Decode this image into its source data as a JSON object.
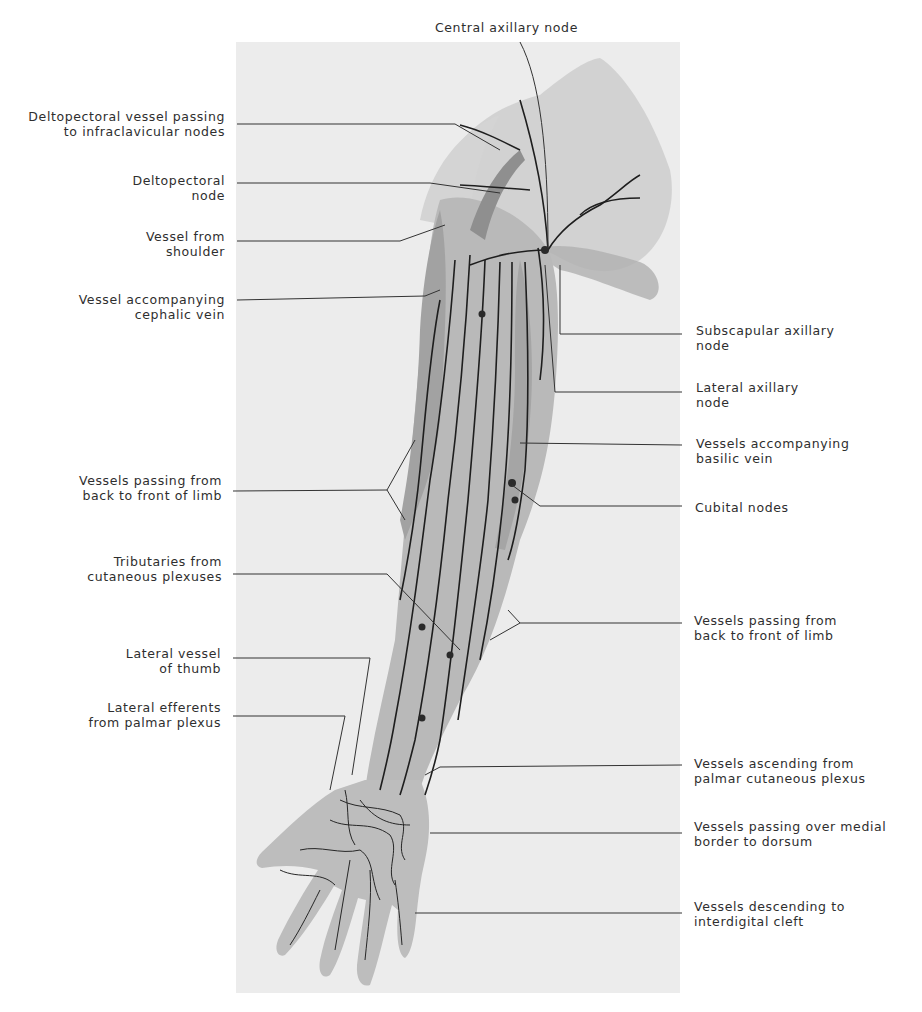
{
  "figure": {
    "colors": {
      "page_background": "#ffffff",
      "panel_background": "#ececec",
      "limb_fill": "#b8b8b8",
      "limb_shadow": "#9a9a9a",
      "vessel": "#1e1e1e",
      "leader_line": "#333333",
      "label_text": "#2e2e2e"
    }
  },
  "labels": {
    "top": {
      "central_axillary_node": {
        "lines": [
          "Central axillary node"
        ]
      }
    },
    "left": [
      {
        "id": "deltopectoral_vessel",
        "lines": [
          "Deltopectoral vessel passing",
          "to infraclavicular nodes"
        ]
      },
      {
        "id": "deltopectoral_node",
        "lines": [
          "Deltopectoral",
          "node"
        ]
      },
      {
        "id": "vessel_from_shoulder",
        "lines": [
          "Vessel from",
          "shoulder"
        ]
      },
      {
        "id": "vessel_cephalic",
        "lines": [
          "Vessel accompanying",
          "cephalic vein"
        ]
      },
      {
        "id": "vessels_back_front_upper",
        "lines": [
          "Vessels passing from",
          "back to front of limb"
        ]
      },
      {
        "id": "tributaries_cutaneous",
        "lines": [
          "Tributaries from",
          "cutaneous plexuses"
        ]
      },
      {
        "id": "lateral_vessel_thumb",
        "lines": [
          "Lateral vessel",
          "of thumb"
        ]
      },
      {
        "id": "lateral_efferents_palmar",
        "lines": [
          "Lateral efferents",
          "from palmar plexus"
        ]
      }
    ],
    "right": [
      {
        "id": "subscapular_axillary_node",
        "lines": [
          "Subscapular axillary",
          "node"
        ]
      },
      {
        "id": "lateral_axillary_node",
        "lines": [
          "Lateral axillary",
          "node"
        ]
      },
      {
        "id": "vessels_basilic",
        "lines": [
          "Vessels accompanying",
          "basilic vein"
        ]
      },
      {
        "id": "cubital_nodes",
        "lines": [
          "Cubital nodes"
        ]
      },
      {
        "id": "vessels_back_front_lower",
        "lines": [
          "Vessels passing from",
          "back to front of limb"
        ]
      },
      {
        "id": "vessels_ascending_palmar",
        "lines": [
          "Vessels ascending from",
          "palmar cutaneous plexus"
        ]
      },
      {
        "id": "vessels_medial_border",
        "lines": [
          "Vessels passing over medial",
          "border to dorsum"
        ]
      },
      {
        "id": "vessels_interdigital",
        "lines": [
          "Vessels descending to",
          "interdigital cleft"
        ]
      }
    ]
  }
}
